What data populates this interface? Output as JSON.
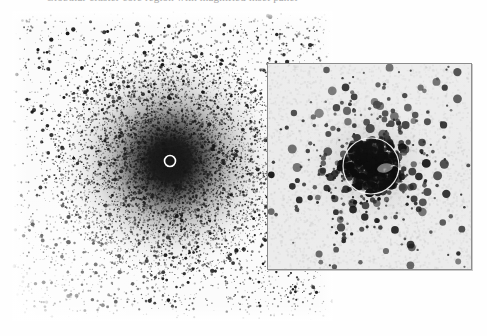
{
  "figure": {
    "background_color": "#fefefe",
    "caption_partial_text": "Globular cluster core region with magnified inset panel",
    "plate_type": "photographic negative"
  },
  "main_plate": {
    "name": "wide-field-star-field",
    "x": 12,
    "y": 11,
    "width": 321,
    "height": 310,
    "background_color": "#fbfbfb",
    "star_color": "#1c1c1c",
    "halo_color": "#2a2a2a",
    "seed": 20481,
    "field_star_count": 5200,
    "edge_fade_px": 16,
    "cluster": {
      "center_x": 170,
      "center_y": 161,
      "core_radius": 26,
      "halo_radius": 62,
      "outer_radius": 118,
      "core_darkness": 0.97,
      "concentrated_star_count": 9000
    },
    "marker_circle": {
      "name": "center-marker",
      "center_x": 170,
      "center_y": 161,
      "radius": 5.5,
      "stroke_color": "#ffffff",
      "stroke_width": 1.6
    }
  },
  "inset": {
    "name": "core-zoom-panel",
    "x": 267,
    "y": 63,
    "width": 205,
    "height": 207,
    "border_color": "#8c8c8c",
    "border_width": 1,
    "background_color": "#ebebeb",
    "star_color": "#101010",
    "seed": 77321,
    "star_count": 430,
    "min_star_radius": 1.1,
    "max_star_radius": 4.6,
    "cluster": {
      "center_x": 103,
      "center_y": 102,
      "core_radius": 30,
      "halo_radius": 70,
      "core_density_boost": 3.4
    },
    "marker_circle": {
      "name": "core-aperture-marker",
      "center_x": 103,
      "center_y": 102,
      "radius": 28,
      "stroke_color": "#f6f6f6",
      "stroke_width": 1.2
    }
  }
}
